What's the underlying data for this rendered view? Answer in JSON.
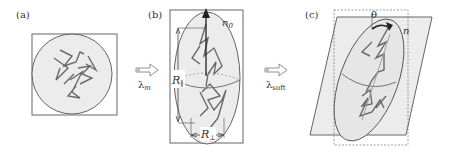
{
  "panels": {
    "a": {
      "label": "(a)"
    },
    "b": {
      "label": "(b)",
      "director_label": "n",
      "director_sub": "0",
      "r_parallel": "R",
      "r_parallel_sub": "∥",
      "r_perp": "R",
      "r_perp_sub": "⊥"
    },
    "c": {
      "label": "(c)",
      "angle_label": "θ",
      "director_label": "n"
    }
  },
  "arrows": [
    {
      "symbol": "λ",
      "sub": "m"
    },
    {
      "symbol": "λ",
      "sub": "soft"
    }
  ],
  "colors": {
    "line": "#555555",
    "fill": "#ececec",
    "chain": "#6a6a6a",
    "box": "#666666"
  }
}
